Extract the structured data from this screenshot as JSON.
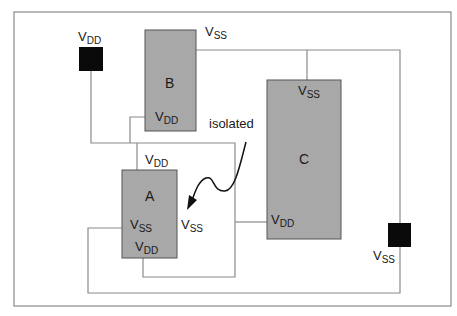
{
  "diagram": {
    "type": "floorplan-power-connectivity",
    "colors": {
      "block_fill": "#a8a8a8",
      "block_border": "#555555",
      "pad_fill": "#0a0a0a",
      "wire": "#8a8a8a",
      "frame": "#8a8a8a"
    },
    "pads": [
      {
        "id": "vdd_pad",
        "label_main": "V",
        "label_sub": "DD"
      },
      {
        "id": "vss_pad",
        "label_main": "V",
        "label_sub": "SS"
      }
    ],
    "blocks": [
      {
        "id": "B",
        "name": "B",
        "pins": [
          {
            "main": "V",
            "sub": "DD"
          }
        ],
        "ext_label": {
          "main": "V",
          "sub": "SS"
        }
      },
      {
        "id": "C",
        "name": "C",
        "pins": [
          {
            "main": "V",
            "sub": "SS"
          },
          {
            "main": "V",
            "sub": "DD"
          }
        ]
      },
      {
        "id": "A",
        "name": "A",
        "pins": [
          {
            "main": "V",
            "sub": "SS"
          },
          {
            "main": "V",
            "sub": "DD"
          }
        ],
        "top_label": {
          "main": "V",
          "sub": "DD"
        },
        "right_label": {
          "main": "V",
          "sub": "SS"
        }
      }
    ],
    "annotation": {
      "text": "isolated"
    }
  }
}
